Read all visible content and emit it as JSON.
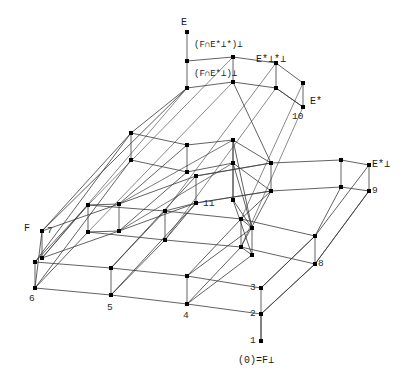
{
  "figure": {
    "type": "lattice-diagram",
    "title": "",
    "background_color": "#ffffff",
    "line_color": "#333333",
    "node_color": "#000000",
    "text_color": "#1a1a1a"
  },
  "labels": {
    "top_E": "E",
    "mid_upper": "(F∩E*⊥*)⊥",
    "mid_lower": "(F∩E*⊥)⊥",
    "e_star_perp_star_perp": "E*⊥*⊥",
    "e_star": "E*",
    "e_star_perp": "E*⊥",
    "left_F": "F",
    "bottom_zero": "(0)=F⊥"
  },
  "nodes": [
    {
      "id": "1",
      "label": "1",
      "x": 261,
      "y": 341,
      "lx": 251,
      "ly": 342
    },
    {
      "id": "2",
      "label": "2",
      "x": 261,
      "y": 314,
      "lx": 251,
      "ly": 315
    },
    {
      "id": "3",
      "label": "3",
      "x": 261,
      "y": 288,
      "lx": 251,
      "ly": 289
    },
    {
      "id": "4",
      "label": "4",
      "x": 187,
      "y": 304,
      "lx": 184,
      "ly": 317
    },
    {
      "id": "5",
      "label": "5",
      "x": 111,
      "y": 295,
      "lx": 108,
      "ly": 309
    },
    {
      "id": "6",
      "label": "6",
      "x": 35,
      "y": 288,
      "lx": 30,
      "ly": 300
    },
    {
      "id": "7",
      "label": "7",
      "x": 42,
      "y": 231,
      "lx": 44,
      "ly": 233
    },
    {
      "id": "8",
      "label": "8",
      "x": 315,
      "y": 264,
      "lx": 318,
      "ly": 266
    },
    {
      "id": "9",
      "label": "9",
      "x": 369,
      "y": 191,
      "lx": 371,
      "ly": 193
    },
    {
      "id": "10",
      "label": "10",
      "x": 303,
      "y": 107,
      "lx": 294,
      "ly": 118
    },
    {
      "id": "11",
      "label": "11",
      "x": 233,
      "y": 200,
      "lx": 205,
      "ly": 206
    }
  ],
  "numbered_node_ids": [
    "1",
    "2",
    "3",
    "4",
    "5",
    "6",
    "7",
    "8",
    "9",
    "10",
    "11"
  ],
  "symbol_labels": [
    {
      "name": "E",
      "text": "E",
      "x": 181,
      "y": 18
    },
    {
      "name": "F-intersect-upper",
      "text": "(F∩E*⊥*)⊥",
      "x": 194,
      "y": 41
    },
    {
      "name": "F-intersect-lower",
      "text": "(F∩E*⊥)⊥",
      "x": 194,
      "y": 70
    },
    {
      "name": "E-star-perp-star-perp",
      "text": "E*⊥*⊥",
      "x": 256,
      "y": 55
    },
    {
      "name": "E-star",
      "text": "E*",
      "x": 310,
      "y": 97
    },
    {
      "name": "E-star-perp",
      "text": "E*⊥",
      "x": 372,
      "y": 160
    },
    {
      "name": "F",
      "text": "F",
      "x": 24,
      "y": 224
    },
    {
      "name": "zero-equals-F-perp",
      "text": "(0)=F⊥",
      "x": 238,
      "y": 356
    }
  ],
  "counts": {
    "nodes_visible": 11,
    "symbol_labels": 8
  }
}
